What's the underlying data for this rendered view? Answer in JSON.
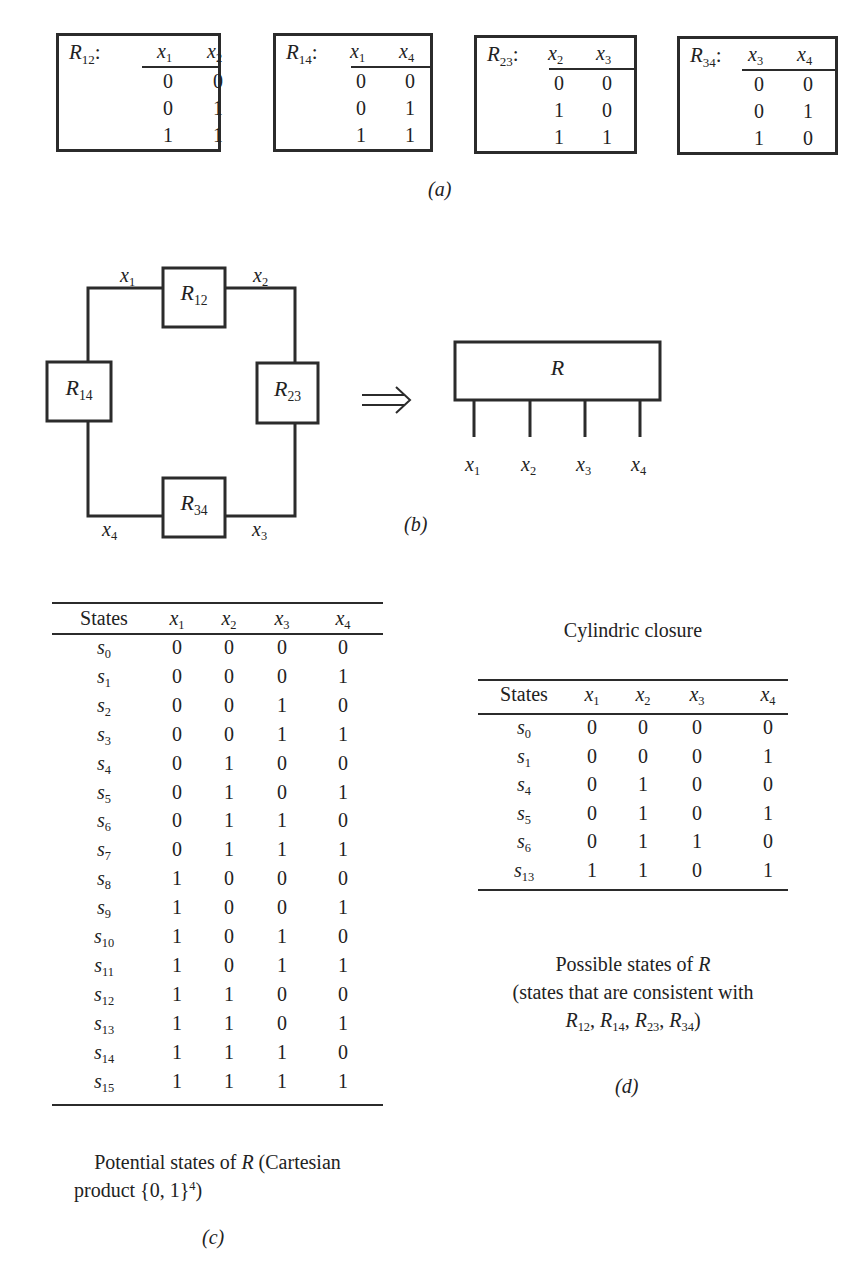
{
  "panel_a": {
    "label": "(a)",
    "relations": [
      {
        "name": "R",
        "sub": "12",
        "colon": ":",
        "cols": [
          {
            "v": "x",
            "s": "1"
          },
          {
            "v": "x",
            "s": "2"
          }
        ],
        "rows": [
          [
            "0",
            "0"
          ],
          [
            "0",
            "1"
          ],
          [
            "1",
            "1"
          ]
        ]
      },
      {
        "name": "R",
        "sub": "14",
        "colon": ":",
        "cols": [
          {
            "v": "x",
            "s": "1"
          },
          {
            "v": "x",
            "s": "4"
          }
        ],
        "rows": [
          [
            "0",
            "0"
          ],
          [
            "0",
            "1"
          ],
          [
            "1",
            "1"
          ]
        ]
      },
      {
        "name": "R",
        "sub": "23",
        "colon": ":",
        "cols": [
          {
            "v": "x",
            "s": "2"
          },
          {
            "v": "x",
            "s": "3"
          }
        ],
        "rows": [
          [
            "0",
            "0"
          ],
          [
            "1",
            "0"
          ],
          [
            "1",
            "1"
          ]
        ]
      },
      {
        "name": "R",
        "sub": "34",
        "colon": ":",
        "cols": [
          {
            "v": "x",
            "s": "3"
          },
          {
            "v": "x",
            "s": "4"
          }
        ],
        "rows": [
          [
            "0",
            "0"
          ],
          [
            "0",
            "1"
          ],
          [
            "1",
            "0"
          ]
        ]
      }
    ]
  },
  "panel_b": {
    "label": "(b)",
    "loop_boxes": [
      {
        "name": "R",
        "sub": "12"
      },
      {
        "name": "R",
        "sub": "14"
      },
      {
        "name": "R",
        "sub": "23"
      },
      {
        "name": "R",
        "sub": "34"
      }
    ],
    "loop_edges": [
      {
        "v": "x",
        "s": "1"
      },
      {
        "v": "x",
        "s": "2"
      },
      {
        "v": "x",
        "s": "3"
      },
      {
        "v": "x",
        "s": "4"
      }
    ],
    "arrow": "⟹",
    "joint_box": {
      "name": "R"
    },
    "joint_vars": [
      {
        "v": "x",
        "s": "1"
      },
      {
        "v": "x",
        "s": "2"
      },
      {
        "v": "x",
        "s": "3"
      },
      {
        "v": "x",
        "s": "4"
      }
    ]
  },
  "panel_c": {
    "label": "(c)",
    "header": {
      "states": "States",
      "vars": [
        {
          "v": "x",
          "s": "1"
        },
        {
          "v": "x",
          "s": "2"
        },
        {
          "v": "x",
          "s": "3"
        },
        {
          "v": "x",
          "s": "4"
        }
      ]
    },
    "rows": [
      {
        "s": "0",
        "vals": [
          "0",
          "0",
          "0",
          "0"
        ]
      },
      {
        "s": "1",
        "vals": [
          "0",
          "0",
          "0",
          "1"
        ]
      },
      {
        "s": "2",
        "vals": [
          "0",
          "0",
          "1",
          "0"
        ]
      },
      {
        "s": "3",
        "vals": [
          "0",
          "0",
          "1",
          "1"
        ]
      },
      {
        "s": "4",
        "vals": [
          "0",
          "1",
          "0",
          "0"
        ]
      },
      {
        "s": "5",
        "vals": [
          "0",
          "1",
          "0",
          "1"
        ]
      },
      {
        "s": "6",
        "vals": [
          "0",
          "1",
          "1",
          "0"
        ]
      },
      {
        "s": "7",
        "vals": [
          "0",
          "1",
          "1",
          "1"
        ]
      },
      {
        "s": "8",
        "vals": [
          "1",
          "0",
          "0",
          "0"
        ]
      },
      {
        "s": "9",
        "vals": [
          "1",
          "0",
          "0",
          "1"
        ]
      },
      {
        "s": "10",
        "vals": [
          "1",
          "0",
          "1",
          "0"
        ]
      },
      {
        "s": "11",
        "vals": [
          "1",
          "0",
          "1",
          "1"
        ]
      },
      {
        "s": "12",
        "vals": [
          "1",
          "1",
          "0",
          "0"
        ]
      },
      {
        "s": "13",
        "vals": [
          "1",
          "1",
          "0",
          "1"
        ]
      },
      {
        "s": "14",
        "vals": [
          "1",
          "1",
          "1",
          "0"
        ]
      },
      {
        "s": "15",
        "vals": [
          "1",
          "1",
          "1",
          "1"
        ]
      }
    ],
    "caption": {
      "line1_pre": "Potential states of ",
      "line1_var": "R",
      "line1_post": " (Cartesian",
      "line2_pre": "product {0, 1}",
      "line2_sup": "4",
      "line2_post": ")"
    }
  },
  "panel_d": {
    "label": "(d)",
    "title": "Cylindric closure",
    "header": {
      "states": "States",
      "vars": [
        {
          "v": "x",
          "s": "1"
        },
        {
          "v": "x",
          "s": "2"
        },
        {
          "v": "x",
          "s": "3"
        },
        {
          "v": "x",
          "s": "4"
        }
      ]
    },
    "rows": [
      {
        "s": "0",
        "vals": [
          "0",
          "0",
          "0",
          "0"
        ]
      },
      {
        "s": "1",
        "vals": [
          "0",
          "0",
          "0",
          "1"
        ]
      },
      {
        "s": "4",
        "vals": [
          "0",
          "1",
          "0",
          "0"
        ]
      },
      {
        "s": "5",
        "vals": [
          "0",
          "1",
          "0",
          "1"
        ]
      },
      {
        "s": "6",
        "vals": [
          "0",
          "1",
          "1",
          "0"
        ]
      },
      {
        "s": "13",
        "vals": [
          "1",
          "1",
          "0",
          "1"
        ]
      }
    ],
    "caption": {
      "line1_pre": "Possible states of ",
      "line1_var": "R",
      "line2": "(states that are consistent with",
      "line3_terms": [
        {
          "v": "R",
          "s": "12"
        },
        {
          "v": "R",
          "s": "14"
        },
        {
          "v": "R",
          "s": "23"
        },
        {
          "v": "R",
          "s": "34"
        }
      ],
      "sep": ", ",
      "close": ")"
    }
  }
}
